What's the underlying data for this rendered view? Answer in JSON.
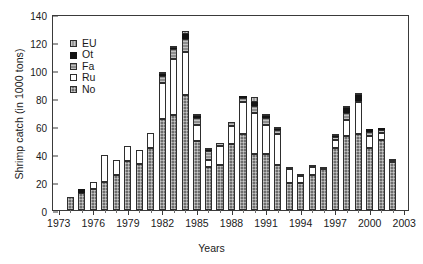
{
  "chart_data": {
    "type": "bar",
    "subtype": "stacked-vertical",
    "title": "",
    "xlabel": "Years",
    "ylabel": "Shrimp catch (in 1000 tons)",
    "ylim": [
      0,
      140
    ],
    "ytick_values": [
      0,
      20,
      40,
      60,
      80,
      100,
      120,
      140
    ],
    "ytick_labels": [
      "0",
      "20",
      "40",
      "60",
      "80",
      "100",
      "120",
      "140"
    ],
    "xlim_years": [
      1973,
      2003
    ],
    "xtick_labels": [
      "1973",
      "1976",
      "1979",
      "1982",
      "1985",
      "1988",
      "1991",
      "1994",
      "1997",
      "2000",
      "2003"
    ],
    "xtick_years": [
      1973,
      1976,
      1979,
      1982,
      1985,
      1988,
      1991,
      1994,
      1997,
      2000,
      2003
    ],
    "grid": false,
    "legend_position": "upper-left-inside",
    "legend_entries": [
      "EU",
      "Ot",
      "Fa",
      "Ru",
      "No"
    ],
    "stack_order_bottom_to_top": [
      "No",
      "Ru",
      "Fa",
      "Ot",
      "EU"
    ],
    "categories": [
      1973,
      1974,
      1975,
      1976,
      1977,
      1978,
      1979,
      1980,
      1981,
      1982,
      1983,
      1984,
      1985,
      1986,
      1987,
      1988,
      1989,
      1990,
      1991,
      1992,
      1993,
      1994,
      1995,
      1996,
      1997,
      1998,
      1999,
      2000,
      2001,
      2002,
      2003
    ],
    "series": [
      {
        "name": "No",
        "label": "No",
        "color": "#6e6e6e",
        "pattern": "cross-hatch",
        "values": [
          0,
          9,
          12,
          15,
          20,
          25,
          35,
          33,
          44,
          65,
          68,
          82,
          49,
          31,
          32,
          47,
          54,
          40,
          40,
          32,
          19,
          19,
          25,
          29,
          44,
          53,
          54,
          44,
          50,
          34,
          0
        ]
      },
      {
        "name": "Ru",
        "label": "Ru",
        "color": "#ffffff",
        "pattern": "solid-white",
        "values": [
          0,
          0,
          0,
          5,
          19,
          11,
          11,
          10,
          11,
          26,
          40,
          31,
          12,
          5,
          14,
          13,
          23,
          29,
          21,
          22,
          10,
          5,
          6,
          2,
          6,
          11,
          23,
          9,
          5,
          1,
          0
        ]
      },
      {
        "name": "Fa",
        "label": "Fa",
        "color": "#8d8d8d",
        "pattern": "horizontal-hatch",
        "values": [
          0,
          0,
          0,
          0,
          0,
          0,
          0,
          0,
          0,
          5,
          7,
          9,
          5,
          6,
          2,
          3,
          3,
          5,
          5,
          3,
          1,
          2,
          1,
          0,
          2,
          5,
          1,
          3,
          2,
          1,
          0
        ]
      },
      {
        "name": "Ot",
        "label": "Ot",
        "color": "#141414",
        "pattern": "solid-black",
        "values": [
          0,
          0,
          3,
          0,
          0,
          0,
          0,
          0,
          0,
          1,
          1,
          4,
          1,
          1,
          0,
          0,
          1,
          3,
          1,
          1,
          0,
          0,
          0,
          0,
          1,
          4,
          4,
          2,
          1,
          0,
          0
        ]
      },
      {
        "name": "EU",
        "label": "EU",
        "color": "#9a9a9a",
        "pattern": "vertical-hatch",
        "values": [
          0,
          0,
          0,
          0,
          0,
          0,
          0,
          0,
          0,
          1,
          1,
          2,
          1,
          1,
          0,
          0,
          0,
          4,
          1,
          1,
          0,
          0,
          0,
          0,
          1,
          1,
          1,
          0,
          0,
          0,
          0
        ]
      }
    ],
    "totals": [
      0,
      9,
      15,
      20,
      39,
      36,
      46,
      43,
      55,
      98,
      117,
      128,
      68,
      44,
      48,
      63,
      81,
      78,
      67,
      58,
      30,
      26,
      32,
      31,
      54,
      74,
      83,
      58,
      58,
      36,
      0
    ]
  }
}
